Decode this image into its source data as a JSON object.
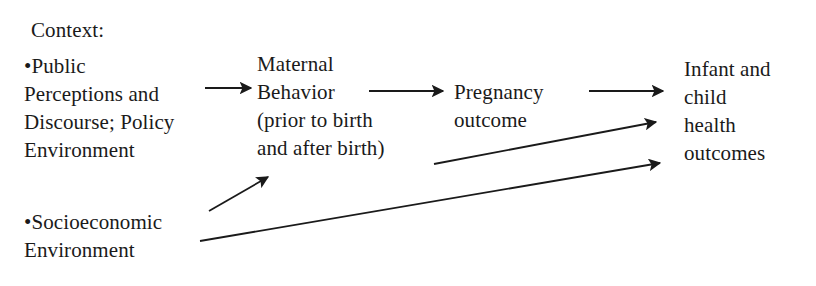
{
  "diagram": {
    "background_color": "#ffffff",
    "ink_color": "#1a1a1a",
    "nodes": {
      "context_heading": "Context:",
      "public_perceptions": "•Public\nPerceptions and\nDiscourse; Policy\nEnvironment",
      "socioeconomic": "•Socioeconomic\nEnvironment",
      "maternal_behavior": "Maternal\nBehavior\n(prior to birth\nand after birth)",
      "pregnancy_outcome": "Pregnancy\noutcome",
      "infant_child_health": "Infant and\nchild\nhealth\noutcomes"
    },
    "node_labels": {
      "context_heading": "Context:",
      "public_perceptions_line1": "•Public",
      "public_perceptions_line2": "Perceptions and",
      "public_perceptions_line3": "Discourse; Policy",
      "public_perceptions_line4": "Environment",
      "socioeconomic_line1": "•Socioeconomic",
      "socioeconomic_line2": "Environment",
      "maternal_line1": "Maternal",
      "maternal_line2": "Behavior",
      "maternal_line3": "(prior to birth",
      "maternal_line4": "and after birth)",
      "pregnancy_line1": "Pregnancy",
      "pregnancy_line2": "outcome",
      "infant_line1": "Infant and",
      "infant_line2": "child",
      "infant_line3": "health",
      "infant_line4": "outcomes"
    },
    "arrows": [
      {
        "name": "arrow-public-to-maternal",
        "from": "public_perceptions",
        "to": "maternal_behavior",
        "x1": 205,
        "y1": 88,
        "x2": 251,
        "y2": 88,
        "style": "straight-horizontal"
      },
      {
        "name": "arrow-maternal-to-pregnancy",
        "from": "maternal_behavior",
        "to": "pregnancy_outcome",
        "x1": 369,
        "y1": 91,
        "x2": 443,
        "y2": 91,
        "style": "straight-horizontal"
      },
      {
        "name": "arrow-pregnancy-to-infant",
        "from": "pregnancy_outcome",
        "to": "infant_child_health",
        "x1": 589,
        "y1": 91,
        "x2": 663,
        "y2": 91,
        "style": "straight-horizontal"
      },
      {
        "name": "arrow-socioeconomic-to-maternal",
        "from": "socioeconomic",
        "to": "maternal_behavior",
        "x1": 209,
        "y1": 211,
        "x2": 268,
        "y2": 177,
        "style": "diagonal-up-short"
      },
      {
        "name": "arrow-maternal-to-infant",
        "from": "maternal_behavior",
        "to": "infant_child_health",
        "x1": 434,
        "y1": 164,
        "x2": 656,
        "y2": 122,
        "style": "diagonal-up-long"
      },
      {
        "name": "arrow-socioeconomic-to-infant",
        "from": "socioeconomic",
        "to": "infant_child_health",
        "x1": 200,
        "y1": 241,
        "x2": 660,
        "y2": 163,
        "style": "diagonal-up-long"
      }
    ]
  }
}
